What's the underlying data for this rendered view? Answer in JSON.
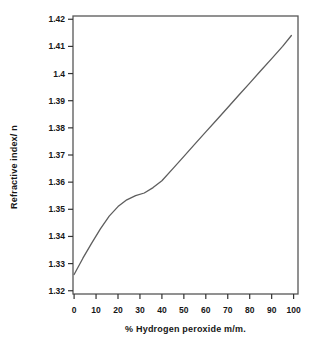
{
  "page": {
    "background": "#ffffff"
  },
  "colors": {
    "text": "#161616",
    "frame": "#575757",
    "tick": "#333333",
    "curve": "#5e5e5e"
  },
  "chart_data": {
    "type": "line",
    "title": "",
    "xlabel": "% Hydrogen peroxide m/m.",
    "ylabel": "Refractive index/ n",
    "xlim": [
      -0.5,
      102
    ],
    "ylim": [
      1.3188,
      1.4212
    ],
    "xticks": [
      0,
      10,
      20,
      30,
      40,
      50,
      60,
      70,
      80,
      90,
      100
    ],
    "xtick_labels": [
      "0",
      "10",
      "20",
      "30",
      "40",
      "50",
      "60",
      "70",
      "80",
      "90",
      "100"
    ],
    "yticks": [
      1.32,
      1.33,
      1.34,
      1.35,
      1.36,
      1.37,
      1.38,
      1.39,
      1.4,
      1.41,
      1.42
    ],
    "ytick_labels": [
      "1.32",
      "1.33",
      "1.34",
      "1.35",
      "1.36",
      "1.37",
      "1.38",
      "1.39",
      "1.4",
      "1.41",
      "1.42"
    ],
    "grid": false,
    "legend_position": "none",
    "series": [
      {
        "x": [
          0,
          4,
          8,
          12,
          16,
          20,
          24,
          28,
          32,
          36,
          40,
          45,
          50,
          55,
          60,
          65,
          70,
          75,
          80,
          85,
          90,
          95,
          99
        ],
        "y": [
          1.326,
          1.332,
          1.3375,
          1.3428,
          1.3475,
          1.351,
          1.3535,
          1.355,
          1.356,
          1.358,
          1.3605,
          1.365,
          1.3695,
          1.374,
          1.3785,
          1.383,
          1.3875,
          1.392,
          1.3965,
          1.401,
          1.4055,
          1.41,
          1.414
        ]
      }
    ]
  }
}
